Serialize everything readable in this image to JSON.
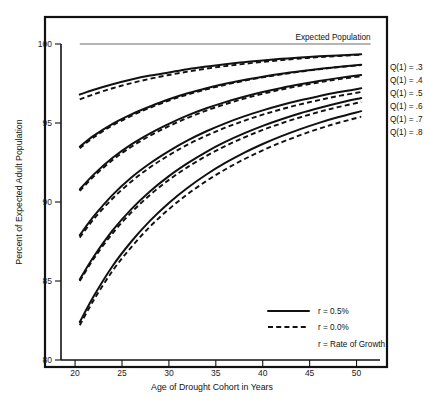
{
  "figure": {
    "background_color": "#ffffff",
    "frame_color": "#111111",
    "curve_color": "#111111",
    "reference_line_color": "#6d6d6d"
  },
  "chart_data": {
    "type": "line",
    "title": "",
    "xlabel": "Age of Drought Cohort in Years",
    "ylabel": "Percent of Expected Adult Population",
    "xlim": [
      18.5,
      52.5
    ],
    "ylim": [
      80,
      101
    ],
    "xticks": [
      20,
      25,
      30,
      35,
      40,
      45,
      50
    ],
    "xtick_labels": [
      "20",
      "25",
      "30",
      "35",
      "40",
      "45",
      "50"
    ],
    "yticks": [
      80,
      85,
      90,
      95,
      100
    ],
    "ytick_labels": [
      "80",
      "85",
      "90",
      "95",
      "100"
    ],
    "grid": false,
    "legend_position": "inside-lower-right",
    "annotations": [
      {
        "name": "expected-population",
        "text": "Expected Population",
        "value": 100,
        "x_start": 20.5,
        "x_end": 51.5,
        "style": "solid-gray-reference-line"
      }
    ],
    "x": [
      20.5,
      22,
      24,
      26,
      28,
      30,
      32,
      34,
      36,
      38,
      40,
      42,
      44,
      46,
      48,
      50.5
    ],
    "series": [
      {
        "name": "Q(1) = .3, r = 0.5%",
        "label": "Q(1) = .3",
        "q": 0.3,
        "r": "0.5%",
        "style": "solid",
        "values": [
          96.8,
          97.1,
          97.45,
          97.75,
          98.0,
          98.2,
          98.4,
          98.57,
          98.72,
          98.85,
          98.96,
          99.06,
          99.14,
          99.22,
          99.28,
          99.35
        ]
      },
      {
        "name": "Q(1) = .3, r = 0.0%",
        "label": "Q(1) = .3",
        "q": 0.3,
        "r": "0.0%",
        "style": "dashed",
        "values": [
          96.5,
          96.82,
          97.2,
          97.52,
          97.8,
          98.04,
          98.25,
          98.44,
          98.6,
          98.74,
          98.87,
          98.98,
          99.08,
          99.17,
          99.24,
          99.32
        ]
      },
      {
        "name": "Q(1) = .4, r = 0.5%",
        "label": "Q(1) = .4",
        "q": 0.4,
        "r": "0.5%",
        "style": "solid",
        "values": [
          93.5,
          94.2,
          94.95,
          95.55,
          96.05,
          96.5,
          96.88,
          97.2,
          97.48,
          97.72,
          97.93,
          98.12,
          98.28,
          98.42,
          98.55,
          98.68
        ]
      },
      {
        "name": "Q(1) = .4, r = 0.0%",
        "label": "Q(1) = .4",
        "q": 0.4,
        "r": "0.0%",
        "style": "dashed",
        "values": [
          93.4,
          94.1,
          94.85,
          95.45,
          95.97,
          96.42,
          96.8,
          97.13,
          97.42,
          97.67,
          97.89,
          98.08,
          98.25,
          98.4,
          98.53,
          98.66
        ]
      },
      {
        "name": "Q(1) = .5, r = 0.5%",
        "label": "Q(1) = .5",
        "q": 0.5,
        "r": "0.5%",
        "style": "solid",
        "values": [
          90.8,
          91.75,
          92.8,
          93.65,
          94.35,
          94.95,
          95.48,
          95.93,
          96.32,
          96.66,
          96.96,
          97.22,
          97.45,
          97.66,
          97.84,
          98.04
        ]
      },
      {
        "name": "Q(1) = .5, r = 0.0%",
        "label": "Q(1) = .5",
        "q": 0.5,
        "r": "0.0%",
        "style": "dashed",
        "values": [
          90.7,
          91.62,
          92.66,
          93.5,
          94.2,
          94.8,
          95.33,
          95.79,
          96.19,
          96.54,
          96.85,
          97.12,
          97.36,
          97.57,
          97.76,
          97.96
        ]
      },
      {
        "name": "Q(1) = .6, r = 0.5%",
        "label": "Q(1) = .6",
        "q": 0.6,
        "r": "0.5%",
        "style": "solid",
        "values": [
          87.9,
          89.1,
          90.45,
          91.55,
          92.45,
          93.22,
          93.9,
          94.48,
          94.98,
          95.42,
          95.8,
          96.14,
          96.44,
          96.7,
          96.94,
          97.2
        ]
      },
      {
        "name": "Q(1) = .6, r = 0.0%",
        "label": "Q(1) = .6",
        "q": 0.6,
        "r": "0.0%",
        "style": "dashed",
        "values": [
          87.75,
          88.92,
          90.22,
          91.3,
          92.2,
          92.96,
          93.63,
          94.2,
          94.7,
          95.14,
          95.53,
          95.87,
          96.18,
          96.45,
          96.7,
          96.96
        ]
      },
      {
        "name": "Q(1) = .7, r = 0.5%",
        "label": "Q(1) = .7",
        "q": 0.7,
        "r": "0.5%",
        "style": "solid",
        "values": [
          85.1,
          86.55,
          88.2,
          89.55,
          90.68,
          91.64,
          92.46,
          93.18,
          93.8,
          94.34,
          94.82,
          95.24,
          95.62,
          95.95,
          96.25,
          96.58
        ]
      },
      {
        "name": "Q(1) = .7, r = 0.0%",
        "label": "Q(1) = .7",
        "q": 0.7,
        "r": "0.0%",
        "style": "dashed",
        "values": [
          85.0,
          86.42,
          88.02,
          89.34,
          90.45,
          91.4,
          92.21,
          92.92,
          93.54,
          94.08,
          94.56,
          94.98,
          95.36,
          95.7,
          96.0,
          96.33
        ]
      },
      {
        "name": "Q(1) = .8, r = 0.5%",
        "label": "Q(1) = .8",
        "q": 0.8,
        "r": "0.5%",
        "style": "solid",
        "values": [
          82.4,
          84.05,
          85.95,
          87.5,
          88.82,
          89.94,
          90.9,
          91.74,
          92.47,
          93.11,
          93.67,
          94.17,
          94.61,
          95.01,
          95.36,
          95.75
        ]
      },
      {
        "name": "Q(1) = .8, r = 0.0%",
        "label": "Q(1) = .8",
        "q": 0.8,
        "r": "0.0%",
        "style": "dashed",
        "values": [
          82.2,
          83.8,
          85.65,
          87.15,
          88.45,
          89.55,
          90.5,
          91.33,
          92.06,
          92.7,
          93.27,
          93.78,
          94.23,
          94.64,
          95.0,
          95.4
        ]
      }
    ]
  },
  "series_labels": [
    {
      "text": "Q(1) = .3"
    },
    {
      "text": "Q(1) = .4"
    },
    {
      "text": "Q(1) = .5"
    },
    {
      "text": "Q(1) = .6"
    },
    {
      "text": "Q(1) = .7"
    },
    {
      "text": "Q(1) = .8"
    }
  ],
  "legend": {
    "entries": [
      {
        "label": "r = 0.5%",
        "style": "solid"
      },
      {
        "label": "r = 0.0%",
        "style": "dashed"
      }
    ],
    "note": "r = Rate of Growth"
  }
}
